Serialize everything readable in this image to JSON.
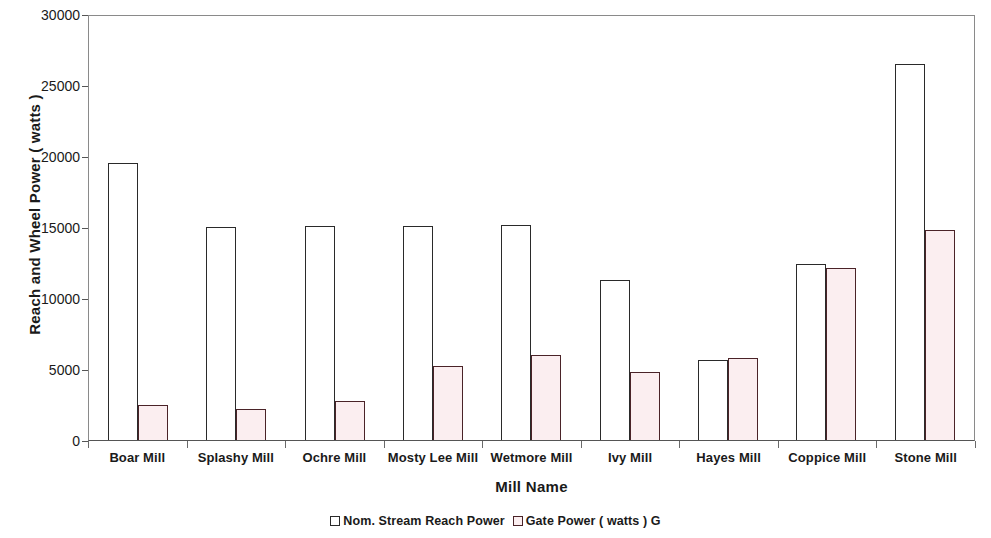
{
  "chart_data": {
    "type": "bar",
    "title": "",
    "xlabel": "Mill Name",
    "ylabel": "Reach and Wheel Power ( watts )",
    "ylim": [
      0,
      30000
    ],
    "yticks": [
      0,
      5000,
      10000,
      15000,
      20000,
      25000,
      30000
    ],
    "ytick_labels": [
      "0",
      "5000",
      "10000",
      "15000",
      "20000",
      "25000",
      "30000"
    ],
    "grid": false,
    "legend_position": "bottom",
    "categories": [
      "Boar Mill",
      "Splashy Mill",
      "Ochre Mill",
      "Mosty Lee Mill",
      "Wetmore Mill",
      "Ivy Mill",
      "Hayes Mill",
      "Coppice Mill",
      "Stone Mill"
    ],
    "series": [
      {
        "name": "Nom. Stream Reach Power",
        "fill": "#ffffff",
        "border": "#2a2a2a",
        "values": [
          19500,
          15000,
          15050,
          15100,
          15150,
          11250,
          5650,
          12400,
          26500
        ]
      },
      {
        "name": "Gate Power ( watts ) G",
        "fill": "#fbeef0",
        "border": "#4a2328",
        "values": [
          2500,
          2200,
          2750,
          5200,
          6000,
          4800,
          5750,
          12100,
          14800
        ]
      }
    ]
  },
  "legend": {
    "items": [
      {
        "label": "Nom. Stream Reach Power",
        "swatch": "series-a-swatch"
      },
      {
        "label": "Gate Power ( watts ) G",
        "swatch": "series-b-swatch"
      }
    ]
  },
  "axes": {
    "x_title": "Mill Name",
    "y_title": "Reach and Wheel Power ( watts )"
  }
}
